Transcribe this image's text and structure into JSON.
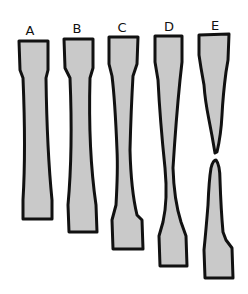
{
  "figure": {
    "fill_color": "#c9c9c9",
    "stroke_color": "#111111",
    "specimens": [
      {
        "label": "A",
        "stage": "uniform elongation",
        "label_x": 30,
        "label_y": 24
      },
      {
        "label": "B",
        "stage": "continued elongation",
        "label_x": 77,
        "label_y": 22
      },
      {
        "label": "C",
        "stage": "necking begins",
        "label_x": 122,
        "label_y": 21
      },
      {
        "label": "D",
        "stage": "pronounced necking",
        "label_x": 169,
        "label_y": 20
      },
      {
        "label": "E",
        "stage": "fracture",
        "label_x": 215,
        "label_y": 19
      }
    ]
  }
}
